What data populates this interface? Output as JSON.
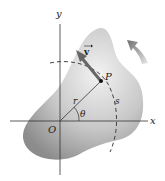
{
  "diagram": {
    "labels": {
      "x_axis": "x",
      "y_axis": "y",
      "origin": "O",
      "point": "P",
      "velocity": "v",
      "radius": "r",
      "angle": "θ",
      "arc_length": "s"
    },
    "colors": {
      "body_light": "#e6e6e6",
      "body_dark": "#9a9a9a",
      "axis": "#333333",
      "arrow": "#666666",
      "rotation_arrow": "#8a8a8a",
      "text": "#222222"
    }
  }
}
